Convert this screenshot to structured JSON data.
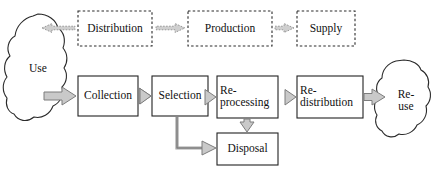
{
  "diagram": {
    "background_color": "#ffffff",
    "stroke_color": "#222222",
    "arrow_fill": "#c9c9c9",
    "arrow_stroke": "#8a8a8a",
    "dashed_stroke": "#333333"
  },
  "supply_chain": {
    "style": "dashed",
    "flow_direction": "right-to-left",
    "nodes": [
      {
        "id": "distribution",
        "label": "Distribution",
        "x": 78,
        "y": 11,
        "w": 74,
        "h": 35
      },
      {
        "id": "production",
        "label": "Production",
        "x": 188,
        "y": 11,
        "w": 84,
        "h": 35
      },
      {
        "id": "supply",
        "label": "Supply",
        "x": 297,
        "y": 11,
        "w": 58,
        "h": 35
      }
    ],
    "arrows": [
      {
        "id": "supply-to-production",
        "from": "supply",
        "to": "production",
        "style": "dashed",
        "direction": "left"
      },
      {
        "id": "production-to-distribution",
        "from": "production",
        "to": "distribution",
        "style": "dashed",
        "direction": "left"
      },
      {
        "id": "distribution-to-use",
        "from": "distribution",
        "to": "use",
        "style": "dashed",
        "direction": "left"
      }
    ]
  },
  "recovery_chain": {
    "style": "solid",
    "flow_direction": "left-to-right",
    "nodes": [
      {
        "id": "collection",
        "label": "Collection",
        "x": 78,
        "y": 76,
        "w": 60,
        "h": 40
      },
      {
        "id": "selection",
        "label": "Selection",
        "x": 152,
        "y": 76,
        "w": 56,
        "h": 40
      },
      {
        "id": "reprocessing",
        "label": "Re-\nprocessing",
        "x": 217,
        "y": 76,
        "w": 61,
        "h": 42
      },
      {
        "id": "redistribution",
        "label": "Re-\ndistribution",
        "x": 297,
        "y": 76,
        "w": 66,
        "h": 42
      },
      {
        "id": "disposal",
        "label": "Disposal",
        "x": 217,
        "y": 133,
        "w": 61,
        "h": 32
      }
    ],
    "arrows": [
      {
        "id": "use-to-collection",
        "from": "use",
        "to": "collection",
        "direction": "right"
      },
      {
        "id": "collection-to-selection",
        "from": "collection",
        "to": "selection",
        "direction": "right"
      },
      {
        "id": "selection-to-reprocessing",
        "from": "selection",
        "to": "reprocessing",
        "direction": "right"
      },
      {
        "id": "reprocessing-to-redistribution",
        "from": "reprocessing",
        "to": "redistribution",
        "direction": "right"
      },
      {
        "id": "redistribution-to-reuse",
        "from": "redistribution",
        "to": "reuse",
        "direction": "right"
      },
      {
        "id": "reprocessing-to-disposal",
        "from": "reprocessing",
        "to": "disposal",
        "direction": "down"
      },
      {
        "id": "selection-to-disposal",
        "from": "selection",
        "to": "disposal",
        "direction": "down-right"
      }
    ]
  },
  "clouds": [
    {
      "id": "use",
      "label": "Use",
      "x": 8,
      "y": 14,
      "w": 62,
      "h": 110
    },
    {
      "id": "reuse",
      "label": "Re-\nuse",
      "x": 382,
      "y": 60,
      "w": 48,
      "h": 80
    }
  ]
}
